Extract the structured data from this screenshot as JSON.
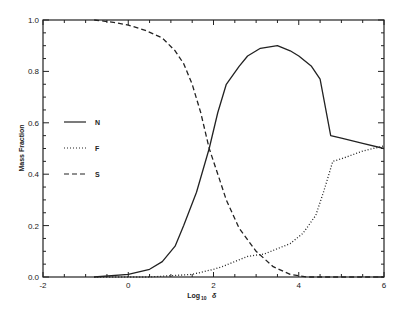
{
  "chart_data": {
    "type": "line",
    "title": "",
    "xlabel": "Log10 δ",
    "xlabel_main": "Log",
    "xlabel_sub": "10",
    "xlabel_symbol": "δ",
    "ylabel": "Mass Fraction",
    "xlim": [
      -2,
      6
    ],
    "ylim": [
      0.0,
      1.0
    ],
    "x_ticks": [
      -2,
      0,
      2,
      4,
      6
    ],
    "x_tick_labels": [
      "-2",
      "0",
      "2",
      "4",
      "6"
    ],
    "y_ticks": [
      0.0,
      0.2,
      0.4,
      0.6,
      0.8,
      1.0
    ],
    "y_tick_labels": [
      "0.0",
      "0.2",
      "0.4",
      "0.6",
      "0.8",
      "1.0"
    ],
    "grid": false,
    "legend_position": "left-inside",
    "series": [
      {
        "name": "N",
        "style": "solid",
        "x": [
          -0.8,
          0.0,
          0.5,
          0.8,
          1.1,
          1.3,
          1.6,
          1.9,
          2.1,
          2.3,
          2.6,
          2.8,
          3.1,
          3.5,
          3.8,
          4.0,
          4.3,
          4.5,
          4.75,
          5.0,
          5.5,
          6.0
        ],
        "y": [
          0.0,
          0.01,
          0.03,
          0.06,
          0.12,
          0.2,
          0.33,
          0.5,
          0.64,
          0.75,
          0.82,
          0.86,
          0.89,
          0.9,
          0.88,
          0.86,
          0.82,
          0.77,
          0.55,
          0.54,
          0.52,
          0.5
        ]
      },
      {
        "name": "F",
        "style": "dotted",
        "x": [
          -0.8,
          0.5,
          1.0,
          1.5,
          2.0,
          2.2,
          2.5,
          2.8,
          3.2,
          3.5,
          3.8,
          4.1,
          4.4,
          4.6,
          4.8,
          5.0,
          5.5,
          6.0
        ],
        "y": [
          0.0,
          0.0,
          0.005,
          0.01,
          0.03,
          0.04,
          0.06,
          0.08,
          0.09,
          0.11,
          0.13,
          0.17,
          0.24,
          0.34,
          0.45,
          0.46,
          0.49,
          0.51
        ]
      },
      {
        "name": "S",
        "style": "dashed",
        "x": [
          -0.8,
          -0.3,
          0.0,
          0.4,
          0.8,
          1.1,
          1.3,
          1.5,
          1.7,
          1.9,
          2.1,
          2.3,
          2.6,
          3.0,
          3.4,
          3.8,
          4.2,
          5.0,
          6.0
        ],
        "y": [
          1.0,
          0.99,
          0.98,
          0.96,
          0.93,
          0.88,
          0.83,
          0.75,
          0.64,
          0.5,
          0.4,
          0.3,
          0.19,
          0.1,
          0.04,
          0.01,
          0.0,
          0.0,
          0.0
        ]
      }
    ],
    "legend": [
      {
        "label": "N",
        "style": "solid"
      },
      {
        "label": "F",
        "style": "dotted"
      },
      {
        "label": "S",
        "style": "dashed"
      }
    ]
  }
}
